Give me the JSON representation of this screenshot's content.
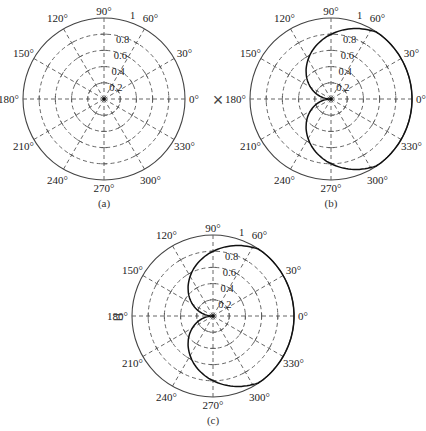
{
  "figure": {
    "operators": {
      "times": "×",
      "equals": "="
    },
    "angle_labels": [
      "0°",
      "30°",
      "60°",
      "90°",
      "120°",
      "150°",
      "180°",
      "210°",
      "240°",
      "270°",
      "300°",
      "330°"
    ],
    "radial_labels": [
      "0.2",
      "0.4",
      "0.6",
      "0.8",
      "1"
    ],
    "plots": [
      {
        "id": "a",
        "caption": "(a)",
        "cx": 104,
        "cy": 99,
        "r": 81,
        "pattern": "none"
      },
      {
        "id": "b",
        "caption": "(b)",
        "cx": 331,
        "cy": 99,
        "r": 81,
        "pattern": "cardioid"
      },
      {
        "id": "c",
        "caption": "(c)",
        "cx": 213,
        "cy": 316,
        "r": 81,
        "pattern": "cardioid"
      }
    ],
    "colors": {
      "grid": "#555555",
      "curve": "#111111",
      "outer": "#444444"
    }
  },
  "chart_data": [
    {
      "type": "polar",
      "title": "(a)",
      "rlim": [
        0,
        1
      ],
      "radial_ticks": [
        0.2,
        0.4,
        0.6,
        0.8,
        1
      ],
      "angular_ticks_deg": [
        0,
        30,
        60,
        90,
        120,
        150,
        180,
        210,
        240,
        270,
        300,
        330
      ],
      "grid": true,
      "series": []
    },
    {
      "type": "polar",
      "title": "(b)",
      "rlim": [
        0,
        1
      ],
      "radial_ticks": [
        0.2,
        0.4,
        0.6,
        0.8,
        1
      ],
      "angular_ticks_deg": [
        0,
        30,
        60,
        90,
        120,
        150,
        180,
        210,
        240,
        270,
        300,
        330
      ],
      "grid": true,
      "series": [
        {
          "name": "pattern",
          "theta_deg": [
            0,
            30,
            60,
            90,
            120,
            150,
            180,
            210,
            240,
            270,
            300,
            330
          ],
          "r": [
            1.0,
            1.0,
            0.95,
            0.8,
            0.57,
            0.3,
            0.0,
            0.3,
            0.57,
            0.8,
            0.95,
            1.0
          ]
        }
      ]
    },
    {
      "type": "polar",
      "title": "(c)",
      "rlim": [
        0,
        1
      ],
      "radial_ticks": [
        0.2,
        0.4,
        0.6,
        0.8,
        1
      ],
      "angular_ticks_deg": [
        0,
        30,
        60,
        90,
        120,
        150,
        180,
        210,
        240,
        270,
        300,
        330
      ],
      "grid": true,
      "series": [
        {
          "name": "pattern",
          "theta_deg": [
            0,
            30,
            60,
            90,
            120,
            150,
            180,
            210,
            240,
            270,
            300,
            330
          ],
          "r": [
            1.0,
            1.0,
            0.95,
            0.8,
            0.57,
            0.3,
            0.0,
            0.3,
            0.57,
            0.8,
            0.95,
            1.0
          ]
        }
      ]
    }
  ]
}
